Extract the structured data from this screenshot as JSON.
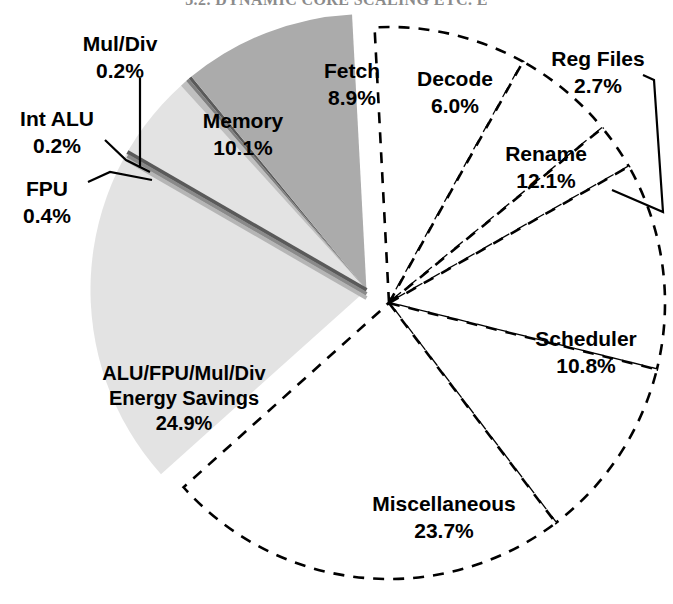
{
  "page": {
    "header_text": "3.2. DYNAMIC CORE SCALING ETC. E"
  },
  "chart_data": {
    "type": "pie",
    "title": "",
    "subtitle": "",
    "xlabel": "",
    "ylabel": "",
    "grid": false,
    "legend_position": "none",
    "units": "percent",
    "start_angle_deg": -93,
    "direction": "clockwise",
    "center": {
      "x": 389,
      "y": 303
    },
    "radius": 276,
    "categories": [
      "Fetch",
      "Decode",
      "Reg Files",
      "Rename",
      "Scheduler",
      "Miscellaneous",
      "ALU/FPU/Mul/Div Energy Savings",
      "FPU",
      "Int ALU",
      "Mul/Div",
      "Memory"
    ],
    "values": [
      8.9,
      6.0,
      2.7,
      12.1,
      10.8,
      23.7,
      24.9,
      0.4,
      0.2,
      0.2,
      10.1
    ],
    "slices": [
      {
        "name": "Fetch",
        "label_line1": "Fetch",
        "label_line2": "8.9%",
        "value": 8.9,
        "value_text": "8.9%",
        "color": "#ffffff",
        "outline": "dashed",
        "exploded": false,
        "label_x": 352,
        "label_y": 72,
        "label_size": "lg",
        "leader": false
      },
      {
        "name": "Decode",
        "label_line1": "Decode",
        "label_line2": "6.0%",
        "value": 6.0,
        "value_text": "6.0%",
        "color": "#ffffff",
        "outline": "dashed",
        "exploded": false,
        "label_x": 455,
        "label_y": 80,
        "label_size": "lg",
        "leader": false
      },
      {
        "name": "Reg Files",
        "label_line1": "Reg Files",
        "label_line2": "2.7%",
        "value": 2.7,
        "value_text": "2.7%",
        "color": "#ffffff",
        "outline": "dashed",
        "exploded": false,
        "label_x": 598,
        "label_y": 60,
        "label_size": "lg",
        "leader": true
      },
      {
        "name": "Rename",
        "label_line1": "Rename",
        "label_line2": "12.1%",
        "value": 12.1,
        "value_text": "12.1%",
        "color": "#ffffff",
        "outline": "dashed",
        "exploded": false,
        "label_x": 546,
        "label_y": 155,
        "label_size": "lg",
        "leader": false
      },
      {
        "name": "Scheduler",
        "label_line1": "Scheduler",
        "label_line2": "10.8%",
        "value": 10.8,
        "value_text": "10.8%",
        "color": "#ffffff",
        "outline": "dashed",
        "exploded": false,
        "label_x": 586,
        "label_y": 340,
        "label_size": "lg",
        "leader": false
      },
      {
        "name": "Miscellaneous",
        "label_line1": "Miscellaneous",
        "label_line2": "23.7%",
        "value": 23.7,
        "value_text": "23.7%",
        "color": "#ffffff",
        "outline": "dashed",
        "exploded": false,
        "label_x": 444,
        "label_y": 505,
        "label_size": "lg",
        "leader": false
      },
      {
        "name": "ALU/FPU/Mul/Div Energy Savings",
        "label_line1": "ALU/FPU/Mul/Div",
        "label_line2": "Energy Savings",
        "label_line3": "24.9%",
        "value": 24.9,
        "value_text": "24.9%",
        "color": "#e3e3e3",
        "outline": "none",
        "exploded": true,
        "label_x": 184,
        "label_y": 375,
        "label_size": "md",
        "leader": false
      },
      {
        "name": "FPU",
        "label_line1": "FPU",
        "label_line2": "0.4%",
        "value": 0.4,
        "value_text": "0.4%",
        "color": "#bfbfbf",
        "outline": "none",
        "exploded": true,
        "label_x": 47,
        "label_y": 190,
        "label_size": "lg",
        "leader": true
      },
      {
        "name": "Int ALU",
        "label_line1": "Int ALU",
        "label_line2": "0.2%",
        "value": 0.2,
        "value_text": "0.2%",
        "color": "#808080",
        "outline": "none",
        "exploded": true,
        "label_x": 57,
        "label_y": 120,
        "label_size": "lg",
        "leader": true
      },
      {
        "name": "Mul/Div",
        "label_line1": "Mul/Div",
        "label_line2": "0.2%",
        "value": 0.2,
        "value_text": "0.2%",
        "color": "#5a5a5a",
        "outline": "none",
        "exploded": true,
        "label_x": 120,
        "label_y": 45,
        "label_size": "lg",
        "leader": true
      },
      {
        "name": "Memory",
        "label_line1": "Memory",
        "label_line2": "10.1%",
        "value": 10.1,
        "value_text": "10.1%",
        "color": "#ababab",
        "outline": "none",
        "exploded": true,
        "label_x": 243,
        "label_y": 122,
        "label_size": "lg",
        "leader": false
      }
    ]
  }
}
